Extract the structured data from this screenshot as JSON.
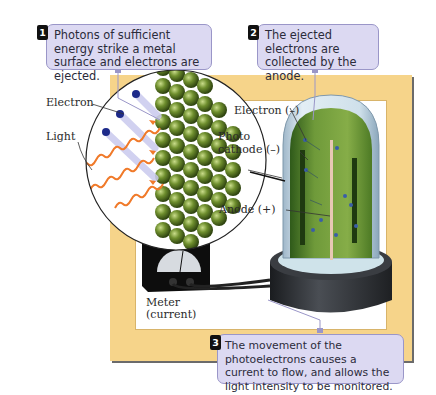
{
  "diagram": {
    "callouts": [
      {
        "number": "1",
        "text": "Photons of sufficient energy strike a metal surface and electrons are ejected."
      },
      {
        "number": "2",
        "text": "The ejected electrons are collected by the anode."
      },
      {
        "number": "3",
        "text": "The movement of the photoelectrons causes a current to flow, and allows the light intensity to be monitored."
      }
    ],
    "labels": {
      "electron_left": "Electron",
      "light": "Light",
      "electron_right": "Electron (–)",
      "photo": "Photo",
      "cathode": "cathode (–)",
      "anode": "Anode (+)",
      "meter": "Meter",
      "current": "(current)"
    },
    "colors": {
      "frame": "#f6d48a",
      "callout_bg": "#dcd9f2",
      "callout_border": "#9a96c8",
      "metal_atoms": "#6b8a2a",
      "photon_wave": "#f07a2a",
      "electron": "#1d2a8a",
      "cathode_green": "#6f9a3a",
      "base": "#2c2f33"
    }
  }
}
